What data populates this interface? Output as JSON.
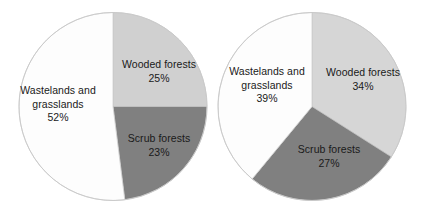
{
  "chart_data": [
    {
      "type": "pie",
      "title": "",
      "id": "left-pie",
      "legend_position": "none",
      "grid": false,
      "categories": [
        "Wooded forests",
        "Scrub forests",
        "Wastelands and grasslands"
      ],
      "values": [
        25,
        23,
        52
      ],
      "labels": [
        "25%",
        "23%",
        "52%"
      ],
      "colors": [
        "#d0d0d0",
        "#808080",
        "#fdfdfd"
      ],
      "slices": [
        {
          "name": "Wooded forests",
          "name_line1": "Wooded forests",
          "name_line2": "",
          "value": 25,
          "label": "25%",
          "color": "#d0d0d0",
          "start_deg": 0,
          "end_deg": 90
        },
        {
          "name": "Scrub forests",
          "name_line1": "Scrub forests",
          "name_line2": "",
          "value": 23,
          "label": "23%",
          "color": "#808080",
          "start_deg": 90,
          "end_deg": 172.8
        },
        {
          "name": "Wastelands and grasslands",
          "name_line1": "Wastelands and",
          "name_line2": "grasslands",
          "value": 52,
          "label": "52%",
          "color": "#fdfdfd",
          "start_deg": 172.8,
          "end_deg": 360
        }
      ]
    },
    {
      "type": "pie",
      "title": "",
      "id": "right-pie",
      "legend_position": "none",
      "grid": false,
      "categories": [
        "Wooded forests",
        "Scrub forests",
        "Wastelands and grasslands"
      ],
      "values": [
        34,
        27,
        39
      ],
      "labels": [
        "34%",
        "27%",
        "39%"
      ],
      "colors": [
        "#d6d6d6",
        "#808080",
        "#fdfdfd"
      ],
      "slices": [
        {
          "name": "Wooded forests",
          "name_line1": "Wooded forests",
          "name_line2": "",
          "value": 34,
          "label": "34%",
          "color": "#d6d6d6",
          "start_deg": 0,
          "end_deg": 122.4
        },
        {
          "name": "Scrub forests",
          "name_line1": "Scrub forests",
          "name_line2": "",
          "value": 27,
          "label": "27%",
          "color": "#808080",
          "start_deg": 122.4,
          "end_deg": 219.6
        },
        {
          "name": "Wastelands and grasslands",
          "name_line1": "Wastelands and",
          "name_line2": "grasslands",
          "value": 39,
          "label": "39%",
          "color": "#fdfdfd",
          "start_deg": 219.6,
          "end_deg": 360
        }
      ]
    }
  ],
  "style": {
    "background": "#ffffff",
    "outline_color": "#c8c8c8",
    "text_color": "#1a1a1a"
  }
}
